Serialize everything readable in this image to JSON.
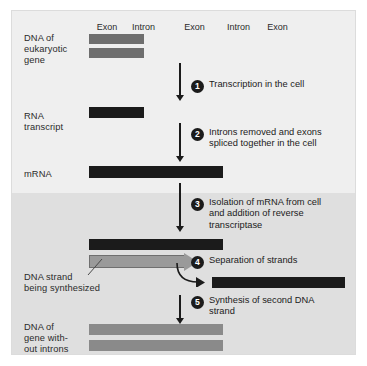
{
  "figure": {
    "background_top": "#efefef",
    "background_bottom": "#dfdfdf"
  },
  "segment_labels": {
    "exon": "Exon",
    "intron": "Intron",
    "row": [
      "Exon",
      "Intron",
      "Exon",
      "Intron",
      "Exon"
    ]
  },
  "rows": {
    "dna_gene": {
      "label": "DNA of\neukaryotic\ngene",
      "segments": [
        "exon",
        "intron",
        "exon",
        "intron",
        "exon"
      ]
    },
    "rna_transcript": {
      "label": "RNA\ntranscript",
      "segments": [
        "exon",
        "intron",
        "exon",
        "intron",
        "exon"
      ]
    },
    "mrna": {
      "label": "mRNA"
    },
    "dna_strand_synth": {
      "label": "DNA strand\nbeing synthesized"
    },
    "dna_no_introns": {
      "label": "DNA of\ngene with-\nout introns"
    }
  },
  "steps": [
    {
      "number": "1",
      "text": "Transcription in the cell"
    },
    {
      "number": "2",
      "text": "Introns removed and exons\nspliced together in the cell"
    },
    {
      "number": "3",
      "text": "Isolation of mRNA from cell\nand addition of reverse\ntranscriptase"
    },
    {
      "number": "4",
      "text": "Separation of strands"
    },
    {
      "number": "5",
      "text": "Synthesis of second DNA\nstrand"
    }
  ],
  "colors": {
    "exon": "#6e6e6e",
    "intron": "#e2e2e2",
    "rna_exon": "#1b1b1b",
    "rna_intron": "#c9c9c9",
    "mrna": "#1b1b1b",
    "dna_product": "#8a8a8a",
    "arrow": "#1b1b1b",
    "gray_arrow": "#9a9a9a"
  }
}
